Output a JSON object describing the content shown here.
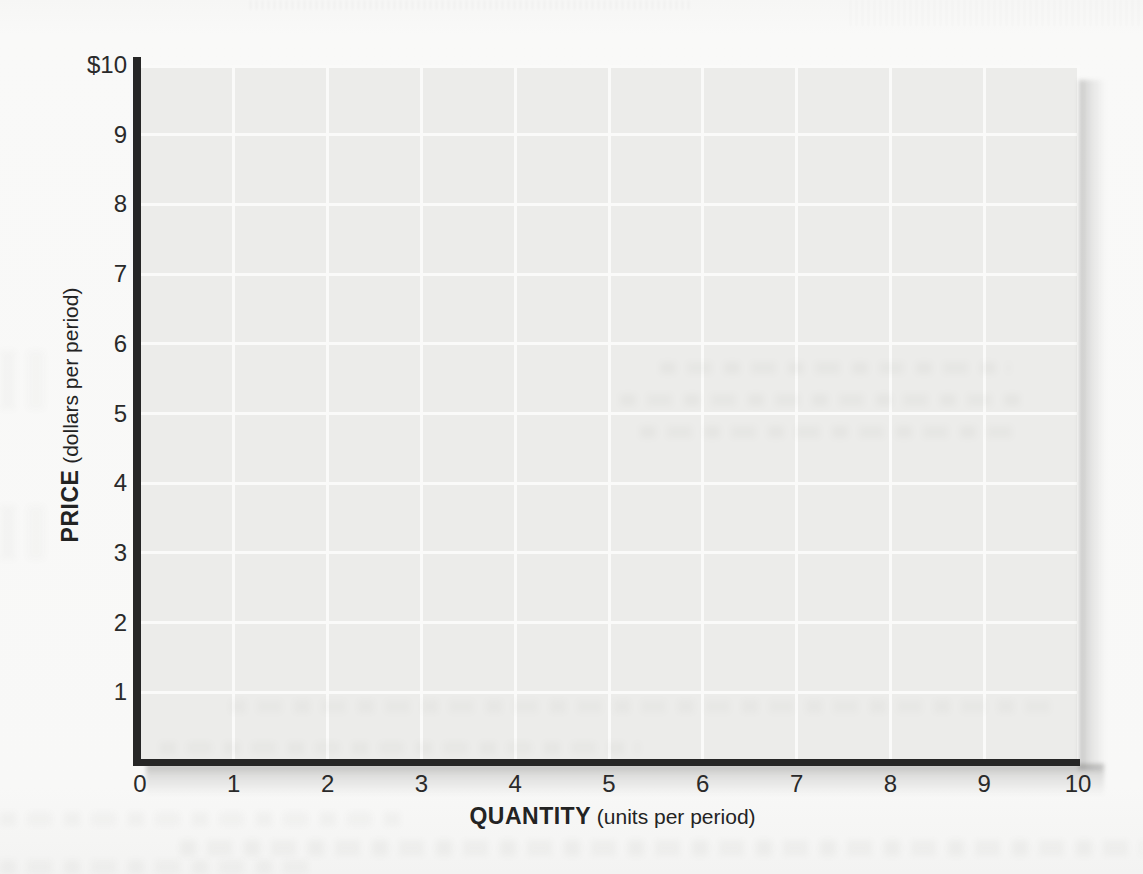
{
  "figure": {
    "kind": "scanned-textbook-graph",
    "colors": {
      "page_bg": "#f8f8f7",
      "plot_bg": "#ececea",
      "gridline": "#fafaf9",
      "axis": "#262626",
      "text": "#2a2a2a"
    }
  },
  "chart_data": {
    "type": "line",
    "title": "",
    "xlabel_bold": "QUANTITY",
    "xlabel_rest": " (units per period)",
    "ylabel_bold": "PRICE",
    "ylabel_rest": " (dollars per period)",
    "xlim": [
      0,
      10
    ],
    "ylim": [
      0,
      10
    ],
    "grid": true,
    "legend": "none",
    "series": [],
    "x_ticks": [
      {
        "v": 0,
        "label": "0"
      },
      {
        "v": 1,
        "label": "1"
      },
      {
        "v": 2,
        "label": "2"
      },
      {
        "v": 3,
        "label": "3"
      },
      {
        "v": 4,
        "label": "4"
      },
      {
        "v": 5,
        "label": "5"
      },
      {
        "v": 6,
        "label": "6"
      },
      {
        "v": 7,
        "label": "7"
      },
      {
        "v": 8,
        "label": "8"
      },
      {
        "v": 9,
        "label": "9"
      },
      {
        "v": 10,
        "label": "10"
      }
    ],
    "y_ticks": [
      {
        "v": 10,
        "label": "$10"
      },
      {
        "v": 9,
        "label": "9"
      },
      {
        "v": 8,
        "label": "8"
      },
      {
        "v": 7,
        "label": "7"
      },
      {
        "v": 6,
        "label": "6"
      },
      {
        "v": 5,
        "label": "5"
      },
      {
        "v": 4,
        "label": "4"
      },
      {
        "v": 3,
        "label": "3"
      },
      {
        "v": 2,
        "label": "2"
      },
      {
        "v": 1,
        "label": "1"
      }
    ]
  }
}
